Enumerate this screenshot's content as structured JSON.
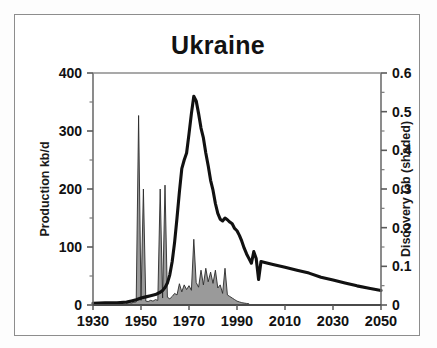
{
  "chart_data": {
    "type": "line",
    "title": "Ukraine",
    "xlabel": "",
    "ylabel": "Production kb/d",
    "y2label": "Discovery Gb (shaded)",
    "xlim": [
      1930,
      2050
    ],
    "ylim": [
      0,
      400
    ],
    "y2lim": [
      0,
      0.6
    ],
    "xticks": [
      1930,
      1950,
      1970,
      1990,
      2010,
      2030,
      2050
    ],
    "xticklabels": [
      "1930",
      "1950",
      "1970",
      "1990",
      "2010",
      "2030",
      "2050"
    ],
    "yticks": [
      0,
      100,
      200,
      300,
      400
    ],
    "yticklabels": [
      "0",
      "100",
      "200",
      "300",
      "400"
    ],
    "y2ticks": [
      0,
      0.1,
      0.2,
      0.3,
      0.4,
      0.5,
      0.6
    ],
    "y2ticklabels": [
      "0",
      "0.1",
      "0.2",
      "0.3",
      "0.4",
      "0.5",
      "0.6"
    ],
    "minor_yticks": [
      50,
      150,
      250,
      350
    ],
    "minor_y2ticks": [
      0.05,
      0.15,
      0.25,
      0.35,
      0.45,
      0.55
    ],
    "grid": false,
    "legend": false,
    "series": [
      {
        "name": "Production kb/d",
        "axis": "left",
        "style": "line",
        "color": "#111111",
        "x": [
          1930,
          1935,
          1940,
          1944,
          1946,
          1948,
          1950,
          1952,
          1954,
          1956,
          1958,
          1959,
          1960,
          1961,
          1962,
          1963,
          1964,
          1965,
          1966,
          1967,
          1968,
          1969,
          1970,
          1971,
          1972,
          1973,
          1974,
          1975,
          1976,
          1977,
          1978,
          1979,
          1980,
          1981,
          1982,
          1983,
          1984,
          1985,
          1986,
          1987,
          1988,
          1989,
          1990,
          1991,
          1992,
          1993,
          1994,
          1995,
          1996,
          1997,
          1998,
          1999,
          2000,
          2002,
          2005,
          2010,
          2015,
          2020,
          2025,
          2030,
          2035,
          2040,
          2045,
          2050
        ],
        "y": [
          3,
          4,
          4,
          5,
          7,
          9,
          12,
          14,
          16,
          18,
          22,
          25,
          30,
          38,
          52,
          75,
          108,
          150,
          195,
          235,
          250,
          262,
          295,
          330,
          360,
          352,
          330,
          305,
          288,
          262,
          240,
          215,
          198,
          175,
          158,
          148,
          145,
          150,
          147,
          143,
          140,
          132,
          128,
          120,
          110,
          98,
          88,
          80,
          72,
          92,
          80,
          44,
          75,
          73,
          70,
          65,
          60,
          55,
          48,
          43,
          38,
          33,
          29,
          25
        ]
      },
      {
        "name": "Discovery Gb (shaded)",
        "axis": "right",
        "style": "area",
        "color": "#9a9a9a",
        "x": [
          1944,
          1945,
          1946,
          1947,
          1948,
          1949,
          1950,
          1951,
          1952,
          1953,
          1954,
          1955,
          1956,
          1957,
          1958,
          1959,
          1960,
          1961,
          1962,
          1963,
          1964,
          1965,
          1966,
          1967,
          1968,
          1969,
          1970,
          1971,
          1972,
          1973,
          1974,
          1975,
          1976,
          1977,
          1978,
          1979,
          1980,
          1981,
          1982,
          1983,
          1984,
          1985,
          1986,
          1987,
          1988,
          1989,
          1990,
          1991,
          1992,
          1993,
          1994,
          1995
        ],
        "y": [
          0.004,
          0.006,
          0.005,
          0.007,
          0.008,
          0.49,
          0.012,
          0.3,
          0.01,
          0.009,
          0.012,
          0.01,
          0.014,
          0.012,
          0.3,
          0.018,
          0.31,
          0.02,
          0.016,
          0.022,
          0.03,
          0.026,
          0.055,
          0.034,
          0.052,
          0.04,
          0.05,
          0.038,
          0.17,
          0.058,
          0.046,
          0.09,
          0.052,
          0.095,
          0.06,
          0.085,
          0.056,
          0.09,
          0.044,
          0.052,
          0.03,
          0.095,
          0.026,
          0.022,
          0.018,
          0.014,
          0.01,
          0.008,
          0.006,
          0.005,
          0.004,
          0.003
        ]
      }
    ],
    "annotations": []
  },
  "figure": {
    "background": "#ffffff",
    "border_color": "#8d8d8d",
    "line_color": "#111111",
    "fill_color": "#9a9a9a"
  }
}
